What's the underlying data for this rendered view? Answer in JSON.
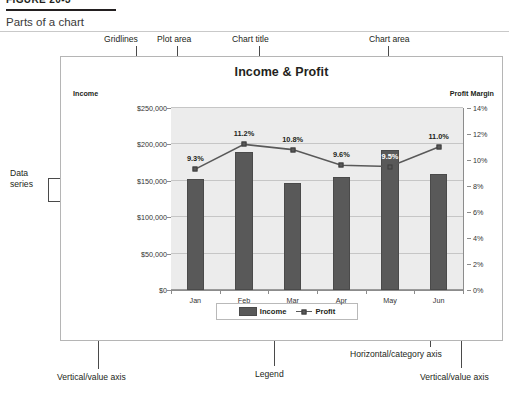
{
  "figure": {
    "label": "FIGURE 20-3",
    "caption": "Parts of a chart"
  },
  "annotations": {
    "gridlines": "Gridlines",
    "plot_area": "Plot area",
    "chart_title": "Chart title",
    "chart_area": "Chart area",
    "data_series": "Data\nseries",
    "data_series_line1": "Data",
    "data_series_line2": "series",
    "vertical_value_axis_left": "Vertical/value axis",
    "legend": "Legend",
    "horizontal_category_axis": "Horizontal/category axis",
    "vertical_value_axis_right": "Vertical/value axis"
  },
  "chart_data": {
    "type": "bar",
    "title": "Income & Profit",
    "xlabel": "",
    "ylabel": "Income",
    "y2label": "Profit Margin",
    "categories": [
      "Jan",
      "Feb",
      "Mar",
      "Apr",
      "May",
      "Jun"
    ],
    "series": [
      {
        "name": "Income",
        "type": "bar",
        "axis": "left",
        "values": [
          152000,
          189000,
          147000,
          155000,
          192000,
          160000
        ],
        "color": "#595959"
      },
      {
        "name": "Profit",
        "type": "line",
        "axis": "right",
        "values": [
          9.3,
          11.2,
          10.8,
          9.6,
          9.5,
          11.0
        ],
        "labels": [
          "9.3%",
          "11.2%",
          "10.8%",
          "9.6%",
          "9.5%",
          "11.0%"
        ],
        "color": "#595959"
      }
    ],
    "ylim": [
      0,
      250000
    ],
    "y2lim": [
      0,
      14
    ],
    "yticks": [
      "$0",
      "$50,000",
      "$100,000",
      "$150,000",
      "$200,000",
      "$250,000"
    ],
    "y2ticks": [
      "0%",
      "2%",
      "4%",
      "6%",
      "8%",
      "10%",
      "12%",
      "14%"
    ],
    "grid": true,
    "legend_position": "bottom",
    "legend_entries": [
      "Income",
      "Profit"
    ],
    "plot_area_color": "#ececec",
    "gridline_color": "#c6c6c6"
  }
}
